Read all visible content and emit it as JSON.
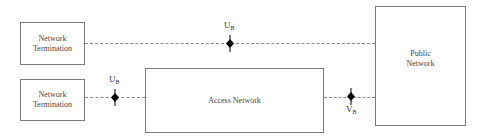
{
  "diagram": {
    "boxes": {
      "nt_top": {
        "line1": "Network",
        "line2": "Termination"
      },
      "nt_bottom": {
        "line1": "Network",
        "line2": "Termination"
      },
      "access": {
        "label": "Access Network"
      },
      "public": {
        "line1": "Public",
        "line2": "Network"
      }
    },
    "reference_points": {
      "ub_top": {
        "main": "U",
        "sub": "B"
      },
      "ub_bottom": {
        "main": "U",
        "sub": "B"
      },
      "vb": {
        "main": "V",
        "sub": "B"
      }
    },
    "colors": {
      "line": "#888888",
      "box_border": "#7a7a7a",
      "node": "#000000"
    }
  }
}
